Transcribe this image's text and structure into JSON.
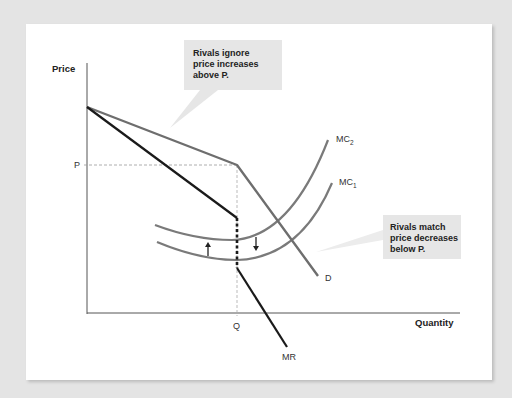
{
  "axes": {
    "y_label": "Price",
    "x_label": "Quantity",
    "y_tick": "P",
    "x_tick": "Q"
  },
  "curves": {
    "demand": {
      "label": "D",
      "color": "#6e6e6e"
    },
    "marginal_revenue": {
      "label": "MR",
      "color": "#1a1a1a"
    },
    "mc1": {
      "label": "MC",
      "subscript": "1",
      "color": "#7a7a7a"
    },
    "mc2": {
      "label": "MC",
      "subscript": "2",
      "color": "#7a7a7a"
    }
  },
  "callouts": [
    {
      "lines": [
        "Rivals ignore",
        "price increases",
        "above P."
      ]
    },
    {
      "lines": [
        "Rivals match",
        "price decreases",
        "below P."
      ]
    }
  ],
  "colors": {
    "background": "#e4e4e4",
    "card": "#ffffff",
    "callout_fill": "#e6e6e6",
    "axis": "#555555"
  }
}
